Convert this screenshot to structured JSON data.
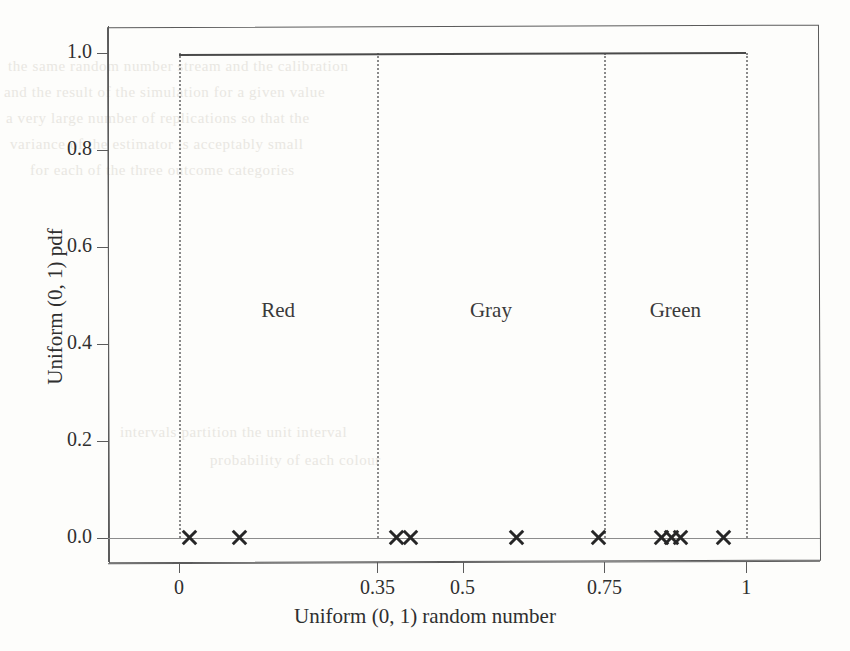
{
  "figure": {
    "background_color": "#fdfdfb",
    "ink_color": "#3a3a3a",
    "grid_color": "#8a8a8a"
  },
  "chart_data": {
    "type": "line",
    "title": "",
    "xlabel": "Uniform (0, 1) random number",
    "ylabel": "Uniform (0, 1) pdf",
    "xlim": [
      -0.125,
      1.13
    ],
    "ylim": [
      -0.05,
      1.055
    ],
    "grid": false,
    "legend": null,
    "x_ticks": [
      0,
      0.35,
      0.5,
      0.75,
      1
    ],
    "x_tick_labels": [
      "0",
      "0.35",
      "0.5",
      "0.75",
      "1"
    ],
    "y_ticks": [
      0.0,
      0.2,
      0.4,
      0.6,
      0.8,
      1.0
    ],
    "y_tick_labels": [
      "0.0",
      "0.2",
      "0.4",
      "0.6",
      "0.8",
      "1.0"
    ],
    "series": [
      {
        "name": "Uniform (0, 1) pdf",
        "type": "line",
        "x": [
          0,
          1
        ],
        "values": [
          1.0,
          1.0
        ],
        "color": "#4a4a4a"
      },
      {
        "name": "baseline",
        "type": "line",
        "x": [
          -0.125,
          1.13
        ],
        "values": [
          0.0,
          0.0
        ],
        "color": "#8c8c8c"
      },
      {
        "name": "random draws",
        "type": "scatter",
        "marker": "x",
        "color": "#262626",
        "x": [
          0.018,
          0.106,
          0.384,
          0.409,
          0.595,
          0.74,
          0.85,
          0.868,
          0.884,
          0.96
        ],
        "values": [
          0,
          0,
          0,
          0,
          0,
          0,
          0,
          0,
          0,
          0
        ]
      }
    ],
    "vertical_dotted_lines": [
      0,
      0.35,
      0.75,
      1
    ],
    "annotations": [
      {
        "text": "Red",
        "x": 0.175,
        "y": 0.47
      },
      {
        "text": "Gray",
        "x": 0.55,
        "y": 0.47
      },
      {
        "text": "Green",
        "x": 0.875,
        "y": 0.47
      }
    ]
  },
  "bleed_through_lines": [
    {
      "text": "the same random number stream and the calibration",
      "x": 8,
      "y": 58
    },
    {
      "text": "and the result of the simulation for a given value",
      "x": 4,
      "y": 84
    },
    {
      "text": "a very large number of replications so that the",
      "x": 6,
      "y": 110
    },
    {
      "text": "variance of the estimator is acceptably small",
      "x": 10,
      "y": 136
    },
    {
      "text": "for each of the three outcome categories",
      "x": 30,
      "y": 162
    },
    {
      "text": "intervals partition the unit interval",
      "x": 120,
      "y": 424
    },
    {
      "text": "probability of each colour",
      "x": 210,
      "y": 452
    }
  ]
}
